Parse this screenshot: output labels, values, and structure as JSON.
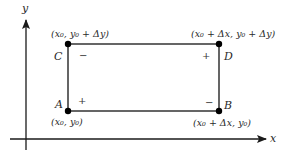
{
  "diagram": {
    "axes": {
      "x_label": "x",
      "y_label": "y"
    },
    "points": {
      "A": {
        "name": "A",
        "coord_label": "(x₀, y₀)"
      },
      "B": {
        "name": "B",
        "coord_label": "(x₀ + Δx, y₀)"
      },
      "C": {
        "name": "C",
        "coord_label": "(x₀, y₀ + Δy)"
      },
      "D": {
        "name": "D",
        "coord_label": "(x₀ + Δx, y₀ + Δy)"
      }
    },
    "signs": {
      "near_A": "+",
      "near_B": "−",
      "near_C": "−",
      "near_D": "+"
    },
    "colors": {
      "axis": "#1a1a1a",
      "rectangle": "#555555",
      "point": "#000000"
    }
  }
}
